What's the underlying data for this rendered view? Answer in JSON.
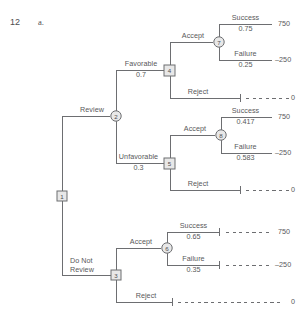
{
  "header": {
    "problem_number": "12",
    "part_letter": "a."
  },
  "diagram": {
    "type": "decision-tree",
    "line_color": "#6d6e71",
    "text_color": "#58585a",
    "node_fill": "#e8e8e8",
    "nodes": [
      {
        "id": "1",
        "shape": "square",
        "label": "1",
        "x": 62,
        "y": 196
      },
      {
        "id": "2",
        "shape": "circle",
        "label": "2",
        "x": 116,
        "y": 116
      },
      {
        "id": "3",
        "shape": "square",
        "label": "3",
        "x": 116,
        "y": 275
      },
      {
        "id": "4",
        "shape": "square",
        "label": "4",
        "x": 170,
        "y": 70
      },
      {
        "id": "5",
        "shape": "square",
        "label": "5",
        "x": 170,
        "y": 163
      },
      {
        "id": "6",
        "shape": "circle",
        "label": "6",
        "x": 167,
        "y": 248
      },
      {
        "id": "7",
        "shape": "circle",
        "label": "7",
        "x": 219,
        "y": 42
      },
      {
        "id": "8",
        "shape": "circle",
        "label": "8",
        "x": 221,
        "y": 135
      }
    ],
    "branches": {
      "review": {
        "label": "Review"
      },
      "do_not_review": {
        "label_line1": "Do Not",
        "label_line2": "Review"
      },
      "favorable": {
        "label": "Favorable",
        "probability": "0.7"
      },
      "unfavorable": {
        "label": "Unfavorable",
        "probability": "0.3"
      },
      "accept": {
        "label": "Accept"
      },
      "reject": {
        "label": "Reject"
      }
    },
    "outcomes": [
      {
        "group": "favorable-accept",
        "label": "Success",
        "probability": "0.75",
        "payoff": "750"
      },
      {
        "group": "favorable-accept",
        "label": "Failure",
        "probability": "0.25",
        "payoff": "–250"
      },
      {
        "group": "favorable-reject",
        "label": "Reject",
        "probability": "",
        "payoff": "0"
      },
      {
        "group": "unfavorable-accept",
        "label": "Success",
        "probability": "0.417",
        "payoff": "750"
      },
      {
        "group": "unfavorable-accept",
        "label": "Failure",
        "probability": "0.583",
        "payoff": "–250"
      },
      {
        "group": "unfavorable-reject",
        "label": "Reject",
        "probability": "",
        "payoff": "0"
      },
      {
        "group": "noreview-accept",
        "label": "Success",
        "probability": "0.65",
        "payoff": "750"
      },
      {
        "group": "noreview-accept",
        "label": "Failure",
        "probability": "0.35",
        "payoff": "–250"
      },
      {
        "group": "noreview-reject",
        "label": "Reject",
        "probability": "",
        "payoff": "0"
      }
    ],
    "payoff_values": {
      "fav_acc_success": "750",
      "fav_acc_failure": "–250",
      "fav_reject": "0",
      "unf_acc_success": "750",
      "unf_acc_failure": "–250",
      "unf_reject": "0",
      "nr_acc_success": "750",
      "nr_acc_failure": "–250",
      "nr_reject": "0"
    }
  }
}
